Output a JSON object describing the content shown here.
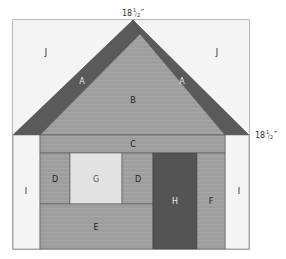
{
  "diagram": {
    "type": "quilt-block",
    "dimensions": {
      "top": {
        "whole": "18",
        "num": "1",
        "den": "2",
        "unit": "″"
      },
      "right": {
        "whole": "18",
        "num": "1",
        "den": "2",
        "unit": "″"
      }
    },
    "colors": {
      "background_light": "#f4f4f4",
      "roof_dark": "#5a5a5a",
      "body_medium": "#9e9e9e",
      "window_light": "#e2e2e2",
      "door_dark": "#545454",
      "stroke": "#555555",
      "label_dark": "#222222",
      "label_light": "#e8e8e8"
    },
    "pieces": [
      {
        "id": "J",
        "label": "J",
        "name": "sky-left"
      },
      {
        "id": "J",
        "label": "J",
        "name": "sky-right"
      },
      {
        "id": "A",
        "label": "A",
        "name": "roof-left"
      },
      {
        "id": "A",
        "label": "A",
        "name": "roof-right"
      },
      {
        "id": "B",
        "label": "B",
        "name": "gable"
      },
      {
        "id": "C",
        "label": "C",
        "name": "eave-strip"
      },
      {
        "id": "D",
        "label": "D",
        "name": "window-side-left"
      },
      {
        "id": "G",
        "label": "G",
        "name": "window"
      },
      {
        "id": "D",
        "label": "D",
        "name": "window-side-right"
      },
      {
        "id": "E",
        "label": "E",
        "name": "lower-wall"
      },
      {
        "id": "H",
        "label": "H",
        "name": "door"
      },
      {
        "id": "F",
        "label": "F",
        "name": "door-side"
      },
      {
        "id": "I",
        "label": "I",
        "name": "side-left"
      },
      {
        "id": "I",
        "label": "I",
        "name": "side-right"
      }
    ]
  }
}
